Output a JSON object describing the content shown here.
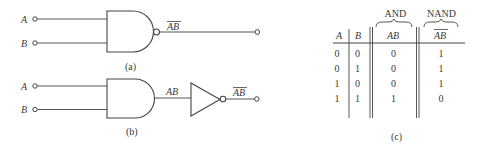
{
  "figure_a": {
    "caption": "(a)",
    "inputs": [
      "A",
      "B"
    ],
    "gate": "NAND",
    "output_label": "AB",
    "output_overbar": true
  },
  "figure_b": {
    "caption": "(b)",
    "inputs": [
      "A",
      "B"
    ],
    "gates": [
      "AND",
      "NOT"
    ],
    "intermediate_label": "AB",
    "output_label": "AB",
    "output_overbar": true
  },
  "figure_c": {
    "caption": "(c)",
    "group_labels": [
      "AND",
      "NAND"
    ],
    "headers": [
      "A",
      "B",
      "AB",
      "AB"
    ],
    "header_overbar": [
      false,
      false,
      false,
      true
    ],
    "rows": [
      [
        "0",
        "0",
        "0",
        "1"
      ],
      [
        "0",
        "1",
        "0",
        "1"
      ],
      [
        "1",
        "0",
        "0",
        "1"
      ],
      [
        "1",
        "1",
        "1",
        "0"
      ]
    ]
  }
}
